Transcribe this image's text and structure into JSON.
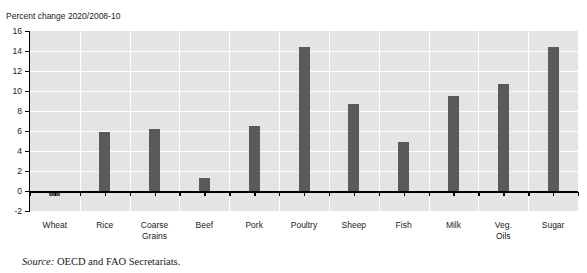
{
  "clipped_header_fragment": "' ' ' ' '",
  "axis_title": "Percent change 2020/2008-10",
  "source": {
    "lead": "Source:",
    "text": " OECD and FAO Secretariats."
  },
  "colors": {
    "bar": "#5a5a5a",
    "plot_background": "#e4e4e4",
    "gridline": "#ffffff",
    "axis": "#000000",
    "text": "#1a1a1a"
  },
  "chart_data": {
    "type": "bar",
    "title": "",
    "subtitle": "",
    "xlabel": "",
    "ylabel": "Percent change 2020/2008-10",
    "ylim": [
      -2,
      16
    ],
    "ytick_step": 2,
    "ytick_labels": [
      "16",
      "14",
      "12",
      "10",
      "8",
      "6",
      "4",
      "2",
      "0",
      "-2"
    ],
    "ytick_values": [
      16,
      14,
      12,
      10,
      8,
      6,
      4,
      2,
      0,
      -2
    ],
    "grid": true,
    "legend": false,
    "orientation": "vertical",
    "categories": [
      "Wheat",
      "Rice",
      "Coarse\nGrains",
      "Beef",
      "Pork",
      "Poultry",
      "Sheep",
      "Fish",
      "Milk",
      "Veg.\nOils",
      "Sugar"
    ],
    "values": [
      -0.5,
      5.9,
      6.2,
      1.3,
      6.5,
      14.4,
      8.7,
      4.9,
      9.5,
      10.7,
      14.4
    ]
  }
}
